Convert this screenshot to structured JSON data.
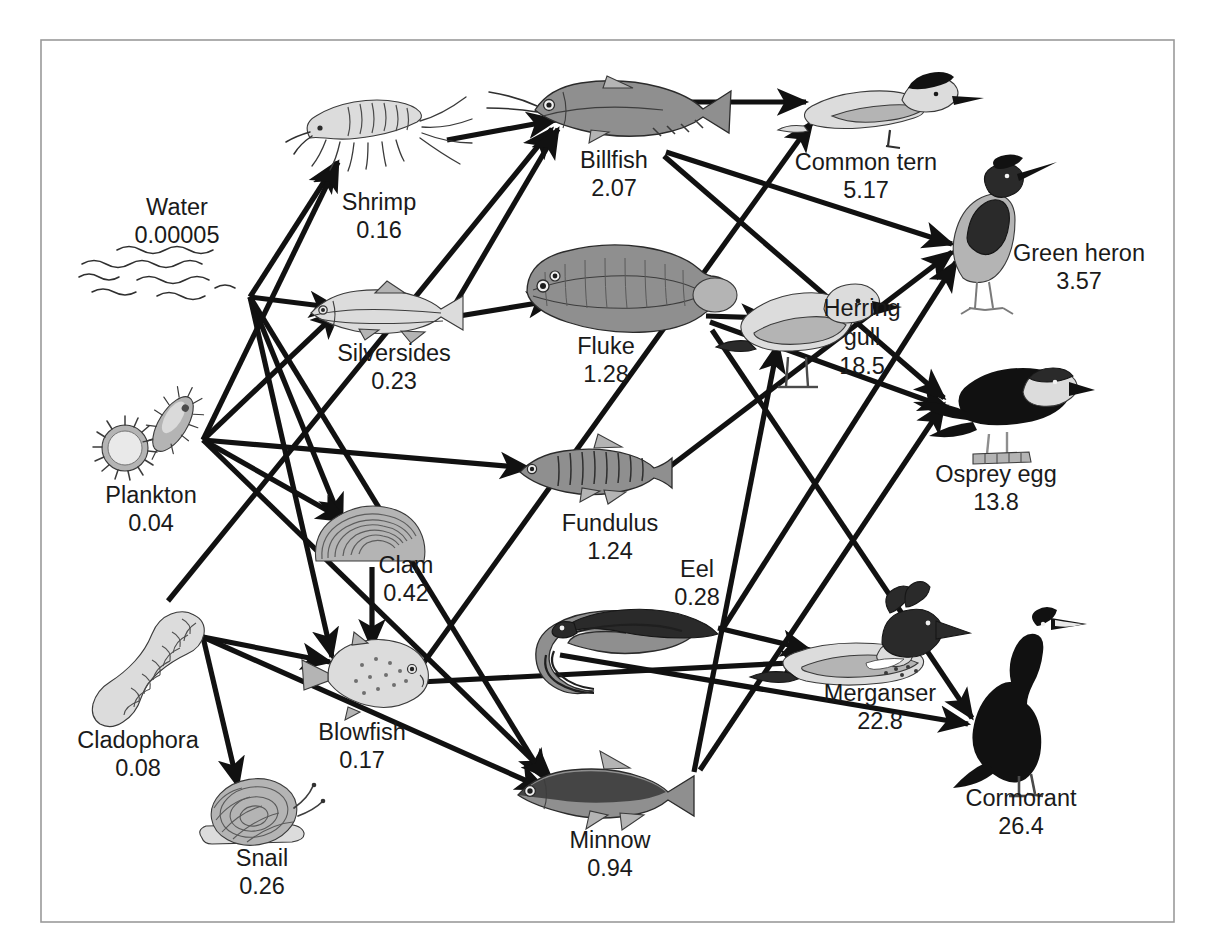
{
  "figure": {
    "type": "food-web-diagram",
    "title": "",
    "caption": "",
    "border_color": "#9a9a9a",
    "background": "#ffffff",
    "arrow_color": "#111111",
    "value_units": "ppm DDT"
  },
  "nodes": [
    {
      "id": "water",
      "label": "Water",
      "value": "0.00005",
      "icon": "water-waves-icon",
      "x": 177,
      "y": 235,
      "label_x": 177,
      "label_y": 215,
      "value_x": 177,
      "value_y": 243
    },
    {
      "id": "plankton",
      "label": "Plankton",
      "value": "0.04",
      "icon": "plankton-icon",
      "x": 151,
      "y": 440,
      "label_x": 151,
      "label_y": 503,
      "value_x": 151,
      "value_y": 531
    },
    {
      "id": "cladophora",
      "label": "Cladophora",
      "value": "0.08",
      "icon": "cladophora-icon",
      "x": 152,
      "y": 663,
      "label_x": 138,
      "label_y": 748,
      "value_x": 138,
      "value_y": 776
    },
    {
      "id": "shrimp",
      "label": "Shrimp",
      "value": "0.16",
      "icon": "shrimp-icon",
      "x": 370,
      "y": 130,
      "label_x": 379,
      "label_y": 210,
      "value_x": 379,
      "value_y": 238
    },
    {
      "id": "silversides",
      "label": "Silversides",
      "value": "0.23",
      "icon": "silversides-icon",
      "x": 389,
      "y": 313,
      "label_x": 394,
      "label_y": 361,
      "value_x": 394,
      "value_y": 389
    },
    {
      "id": "clam",
      "label": "Clam",
      "value": "0.42",
      "icon": "clam-icon",
      "x": 372,
      "y": 537,
      "label_x": 406,
      "label_y": 573,
      "value_x": 406,
      "value_y": 601
    },
    {
      "id": "blowfish",
      "label": "Blowfish",
      "value": "0.17",
      "icon": "blowfish-icon",
      "x": 362,
      "y": 679,
      "label_x": 362,
      "label_y": 740,
      "value_x": 362,
      "value_y": 768
    },
    {
      "id": "snail",
      "label": "Snail",
      "value": "0.26",
      "icon": "snail-icon",
      "x": 260,
      "y": 818,
      "label_x": 262,
      "label_y": 866,
      "value_x": 262,
      "value_y": 894
    },
    {
      "id": "minnow",
      "label": "Minnow",
      "value": "0.94",
      "icon": "minnow-icon",
      "x": 610,
      "y": 793,
      "label_x": 610,
      "label_y": 848,
      "value_x": 610,
      "value_y": 876
    },
    {
      "id": "fundulus",
      "label": "Fundulus",
      "value": "1.24",
      "icon": "fundulus-icon",
      "x": 598,
      "y": 472,
      "label_x": 610,
      "label_y": 531,
      "value_x": 610,
      "value_y": 559
    },
    {
      "id": "eel",
      "label": "Eel",
      "value": "0.28",
      "icon": "eel-icon",
      "x": 640,
      "y": 645,
      "label_x": 697,
      "label_y": 577,
      "value_x": 697,
      "value_y": 605
    },
    {
      "id": "fluke",
      "label": "Fluke",
      "value": "1.28",
      "icon": "fluke-icon",
      "x": 625,
      "y": 288,
      "label_x": 606,
      "label_y": 354,
      "value_x": 606,
      "value_y": 382
    },
    {
      "id": "billfish",
      "label": "Billfish",
      "value": "2.07",
      "icon": "billfish-icon",
      "x": 613,
      "y": 114,
      "label_x": 614,
      "label_y": 168,
      "value_x": 614,
      "value_y": 196
    },
    {
      "id": "commontern",
      "label": "Common tern",
      "value": "5.17",
      "icon": "tern-icon",
      "x": 872,
      "y": 110,
      "label_x": 866,
      "label_y": 170,
      "value_x": 866,
      "value_y": 198
    },
    {
      "id": "greenheron",
      "label": "Green heron",
      "value": "3.57",
      "icon": "heron-icon",
      "x": 985,
      "y": 238,
      "label_x": 1079,
      "label_y": 261,
      "value_x": 1079,
      "value_y": 289
    },
    {
      "id": "herringgull",
      "label": "Herring",
      "label2": "gull",
      "value": "18.5",
      "icon": "gull-icon",
      "x": 802,
      "y": 331,
      "label_x": 862,
      "label_y": 316,
      "label2_y": 345,
      "value_x": 862,
      "value_y": 374
    },
    {
      "id": "ospreyegg",
      "label": "Osprey egg",
      "value": "13.8",
      "icon": "osprey-icon",
      "x": 993,
      "y": 412,
      "label_x": 996,
      "label_y": 482,
      "value_x": 996,
      "value_y": 510
    },
    {
      "id": "merganser",
      "label": "Merganser",
      "value": "22.8",
      "icon": "merganser-icon",
      "x": 872,
      "y": 657,
      "label_x": 880,
      "label_y": 701,
      "value_x": 880,
      "value_y": 729
    },
    {
      "id": "cormorant",
      "label": "Cormorant",
      "value": "26.4",
      "icon": "cormorant-icon",
      "x": 1021,
      "y": 712,
      "label_x": 1021,
      "label_y": 806,
      "value_x": 1021,
      "value_y": 834
    }
  ],
  "edges": [
    {
      "from": "water",
      "to": "shrimp"
    },
    {
      "from": "water",
      "to": "silversides"
    },
    {
      "from": "water",
      "to": "clam"
    },
    {
      "from": "water",
      "to": "blowfish"
    },
    {
      "from": "water",
      "to": "minnow"
    },
    {
      "from": "plankton",
      "to": "shrimp"
    },
    {
      "from": "plankton",
      "to": "silversides"
    },
    {
      "from": "plankton",
      "to": "fundulus"
    },
    {
      "from": "plankton",
      "to": "clam"
    },
    {
      "from": "plankton",
      "to": "minnow"
    },
    {
      "from": "cladophora",
      "to": "blowfish"
    },
    {
      "from": "cladophora",
      "to": "snail"
    },
    {
      "from": "cladophora",
      "to": "minnow"
    },
    {
      "from": "cladophora",
      "to": "billfish"
    },
    {
      "from": "shrimp",
      "to": "billfish"
    },
    {
      "from": "silversides",
      "to": "billfish"
    },
    {
      "from": "silversides",
      "to": "fluke"
    },
    {
      "from": "clam",
      "to": "blowfish"
    },
    {
      "from": "blowfish",
      "to": "merganser"
    },
    {
      "from": "minnow",
      "to": "herringgull"
    },
    {
      "from": "fundulus",
      "to": "greenheron"
    },
    {
      "from": "eel",
      "to": "merganser"
    },
    {
      "from": "eel",
      "to": "greenheron"
    },
    {
      "from": "fluke",
      "to": "herringgull"
    },
    {
      "from": "fluke",
      "to": "ospreyegg"
    },
    {
      "from": "fluke",
      "to": "cormorant"
    },
    {
      "from": "billfish",
      "to": "commontern"
    },
    {
      "from": "billfish",
      "to": "greenheron"
    },
    {
      "from": "billfish",
      "to": "ospreyegg"
    },
    {
      "from": "blowfish",
      "to": "commontern"
    },
    {
      "from": "minnow",
      "to": "ospreyegg"
    },
    {
      "from": "eel",
      "to": "cormorant"
    }
  ],
  "chart_data": {
    "type": "diagram",
    "series": [
      {
        "name": "Water",
        "value": 5e-05
      },
      {
        "name": "Plankton",
        "value": 0.04
      },
      {
        "name": "Cladophora",
        "value": 0.08
      },
      {
        "name": "Shrimp",
        "value": 0.16
      },
      {
        "name": "Blowfish",
        "value": 0.17
      },
      {
        "name": "Silversides",
        "value": 0.23
      },
      {
        "name": "Snail",
        "value": 0.26
      },
      {
        "name": "Eel",
        "value": 0.28
      },
      {
        "name": "Clam",
        "value": 0.42
      },
      {
        "name": "Minnow",
        "value": 0.94
      },
      {
        "name": "Fundulus",
        "value": 1.24
      },
      {
        "name": "Fluke",
        "value": 1.28
      },
      {
        "name": "Billfish",
        "value": 2.07
      },
      {
        "name": "Green heron",
        "value": 3.57
      },
      {
        "name": "Common tern",
        "value": 5.17
      },
      {
        "name": "Osprey egg",
        "value": 13.8
      },
      {
        "name": "Herring gull",
        "value": 18.5
      },
      {
        "name": "Merganser",
        "value": 22.8
      },
      {
        "name": "Cormorant",
        "value": 26.4
      }
    ],
    "xlabel": "",
    "ylabel": "",
    "legend": []
  }
}
